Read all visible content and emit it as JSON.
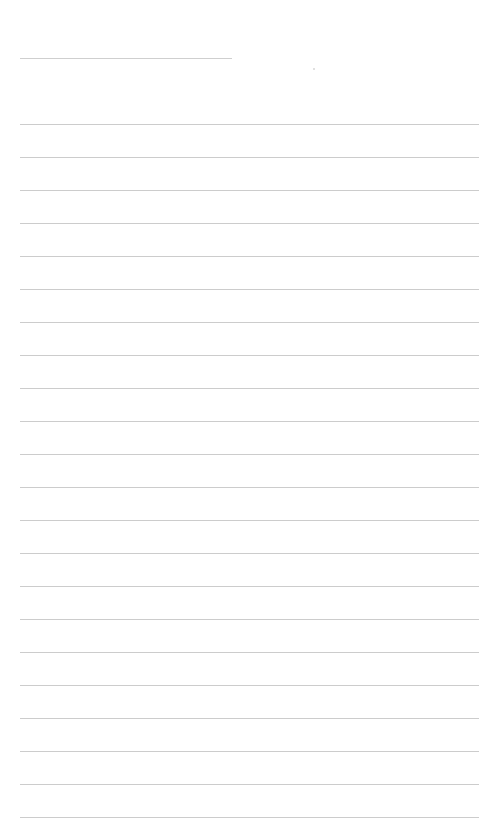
{
  "page": {
    "type": "lined-paper",
    "background_color": "#ffffff",
    "line_color": "#cccccc",
    "header_line": {
      "x": 20,
      "y": 58,
      "width": 212
    },
    "mark": {
      "x": 313,
      "y": 68
    },
    "ruled_lines": {
      "count": 22,
      "first_y": 124,
      "spacing": 33,
      "x_start": 20,
      "x_end": 479
    }
  }
}
